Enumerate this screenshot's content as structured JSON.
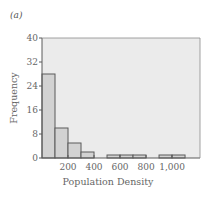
{
  "panel_label": "(a)",
  "chart_data": {
    "type": "bar",
    "title": "",
    "xlabel": "Population Density",
    "ylabel": "Frequency",
    "bin_width": 100,
    "bins": [
      {
        "start": 0,
        "end": 100,
        "value": 28
      },
      {
        "start": 100,
        "end": 200,
        "value": 10
      },
      {
        "start": 200,
        "end": 300,
        "value": 5
      },
      {
        "start": 300,
        "end": 400,
        "value": 2
      },
      {
        "start": 400,
        "end": 500,
        "value": 0
      },
      {
        "start": 500,
        "end": 600,
        "value": 1
      },
      {
        "start": 600,
        "end": 700,
        "value": 1
      },
      {
        "start": 700,
        "end": 800,
        "value": 1
      },
      {
        "start": 800,
        "end": 900,
        "value": 0
      },
      {
        "start": 900,
        "end": 1000,
        "value": 1
      },
      {
        "start": 1000,
        "end": 1100,
        "value": 1
      }
    ],
    "x_ticks": [
      200,
      400,
      600,
      800,
      1000
    ],
    "x_tick_labels": [
      "200",
      "400",
      "600",
      "800",
      "1,000"
    ],
    "y_ticks": [
      0,
      8,
      16,
      24,
      32,
      40
    ],
    "y_tick_labels": [
      "0",
      "8",
      "16",
      "24",
      "32",
      "40"
    ],
    "xlim": [
      0,
      1215
    ],
    "ylim": [
      0,
      40
    ],
    "grid": false,
    "colors": {
      "plot_bg": "#ebebeb",
      "bar_fill": "#d2d2d2",
      "bar_stroke": "#5a5a5a",
      "axis": "#5a5a5a"
    }
  }
}
